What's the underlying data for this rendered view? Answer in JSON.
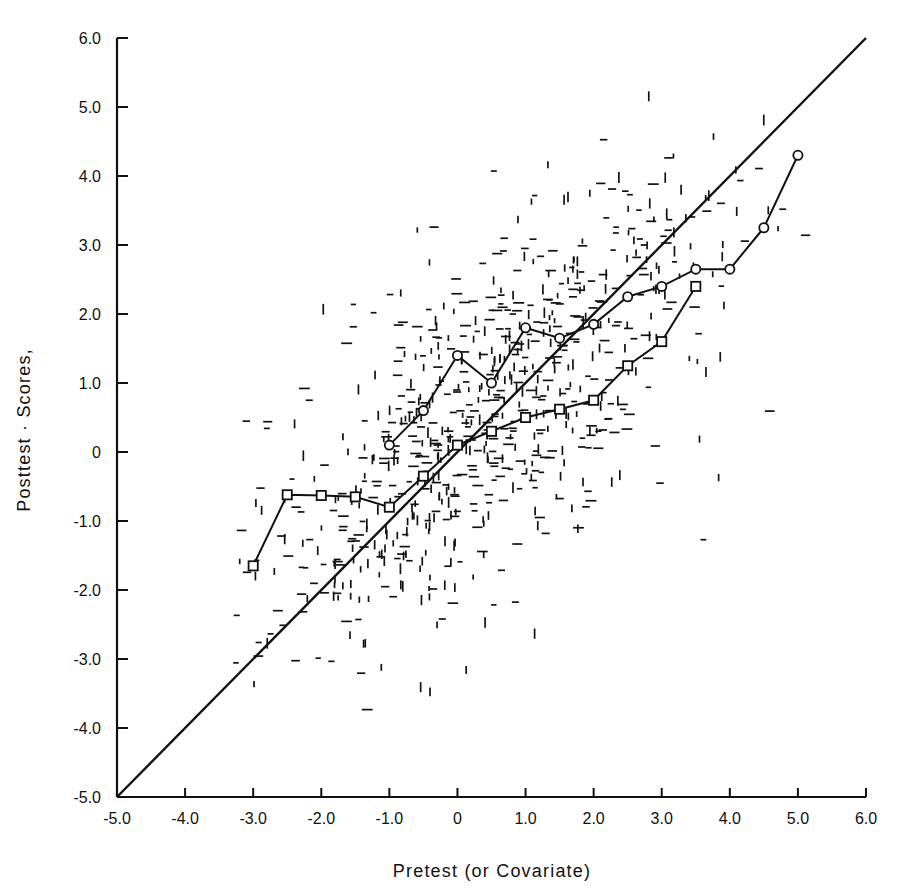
{
  "chart_data": {
    "type": "scatter",
    "title": "",
    "xlabel": "Pretest  (or  Covariate)",
    "ylabel": "Posttest · Scores,",
    "xlim": [
      -5.0,
      6.0
    ],
    "ylim": [
      -5.0,
      6.0
    ],
    "grid": false,
    "legend": "none",
    "xticklabels": [
      "-5.0",
      "-4.0",
      "-3.0",
      "-2.0",
      "-1.0",
      "0",
      "1.0",
      "2.0",
      "3.0",
      "4.0",
      "5.0",
      "6.0"
    ],
    "xticks": [
      -5,
      -4,
      -3,
      -2,
      -1,
      0,
      1,
      2,
      3,
      4,
      5,
      6
    ],
    "yticklabels": [
      "6.0",
      "5.0",
      "4.0",
      "3.0",
      "2.0",
      "1.0",
      "0",
      "-1.0",
      "-2.0",
      "-3.0",
      "-4.0",
      "-5.0"
    ],
    "yticks": [
      6,
      5,
      4,
      3,
      2,
      1,
      0,
      -1,
      -2,
      -3,
      -4,
      -5
    ],
    "series": [
      {
        "name": "identity-line",
        "type": "line",
        "style": "solid-plain",
        "points": [
          [
            -5.0,
            -5.0
          ],
          [
            6.0,
            6.0
          ]
        ]
      },
      {
        "name": "upper-regression-means",
        "type": "line",
        "marker": "circle",
        "points": [
          [
            -1.0,
            0.1
          ],
          [
            -0.5,
            0.6
          ],
          [
            0.0,
            1.4
          ],
          [
            0.5,
            1.0
          ],
          [
            1.0,
            1.8
          ],
          [
            1.5,
            1.65
          ],
          [
            2.0,
            1.85
          ],
          [
            2.5,
            2.25
          ],
          [
            3.0,
            2.4
          ],
          [
            3.5,
            2.65
          ],
          [
            4.0,
            2.65
          ],
          [
            4.5,
            3.25
          ],
          [
            5.0,
            4.3
          ]
        ]
      },
      {
        "name": "lower-regression-means",
        "type": "line",
        "marker": "square",
        "points": [
          [
            -3.0,
            -1.65
          ],
          [
            -2.5,
            -0.62
          ],
          [
            -2.0,
            -0.63
          ],
          [
            -1.5,
            -0.65
          ],
          [
            -1.0,
            -0.8
          ],
          [
            -0.5,
            -0.35
          ],
          [
            0.0,
            0.1
          ],
          [
            0.5,
            0.3
          ],
          [
            1.0,
            0.5
          ],
          [
            1.5,
            0.62
          ],
          [
            2.0,
            0.75
          ],
          [
            2.5,
            1.25
          ],
          [
            3.0,
            1.6
          ],
          [
            3.5,
            2.4
          ]
        ]
      },
      {
        "name": "scatter-cloud",
        "type": "scatter",
        "marker": "tick-dash",
        "n_points": 760,
        "description": "Dense bivariate cloud of small horizontal and vertical dash marks, positively correlated, centered near (0.6, 0.6), x from -3.2 to 5.8, y from -4.2 to 6.0",
        "center": [
          0.6,
          0.6
        ],
        "correlation": 0.72,
        "sd_x": 1.75,
        "sd_y": 1.75
      }
    ]
  },
  "figure": {
    "caption": "",
    "background": "#ffffff",
    "ink": "#111111"
  }
}
